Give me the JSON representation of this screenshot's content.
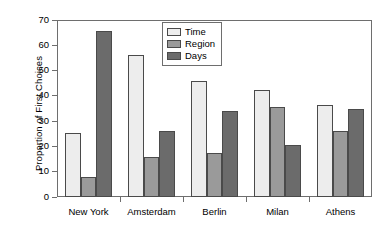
{
  "chart_data": {
    "type": "bar",
    "title": "",
    "xlabel": "",
    "ylabel": "Proportion of First Choices",
    "categories": [
      "New York",
      "Amsterdam",
      "Berlin",
      "Milan",
      "Athens"
    ],
    "series": [
      {
        "name": "Time",
        "color": "#ededed",
        "values": [
          25.5,
          56.0,
          46.0,
          42.5,
          36.5
        ]
      },
      {
        "name": "Region",
        "color": "#9a9a9a",
        "values": [
          7.8,
          15.8,
          17.5,
          35.5,
          26.0
        ]
      },
      {
        "name": "Days",
        "color": "#6b6b6b",
        "values": [
          65.5,
          26.0,
          34.0,
          20.5,
          35.0
        ]
      }
    ],
    "ylim": [
      0,
      70
    ],
    "yticks": [
      0,
      10,
      20,
      30,
      40,
      50,
      60,
      70
    ],
    "ytick_labels": [
      "0",
      "10",
      "20",
      "30",
      "40",
      "50",
      "60",
      "70"
    ],
    "grid": false,
    "legend_position": "top-center",
    "axis_color": "#6e6e6e",
    "bar_edge_color": "#4a4a4a"
  }
}
